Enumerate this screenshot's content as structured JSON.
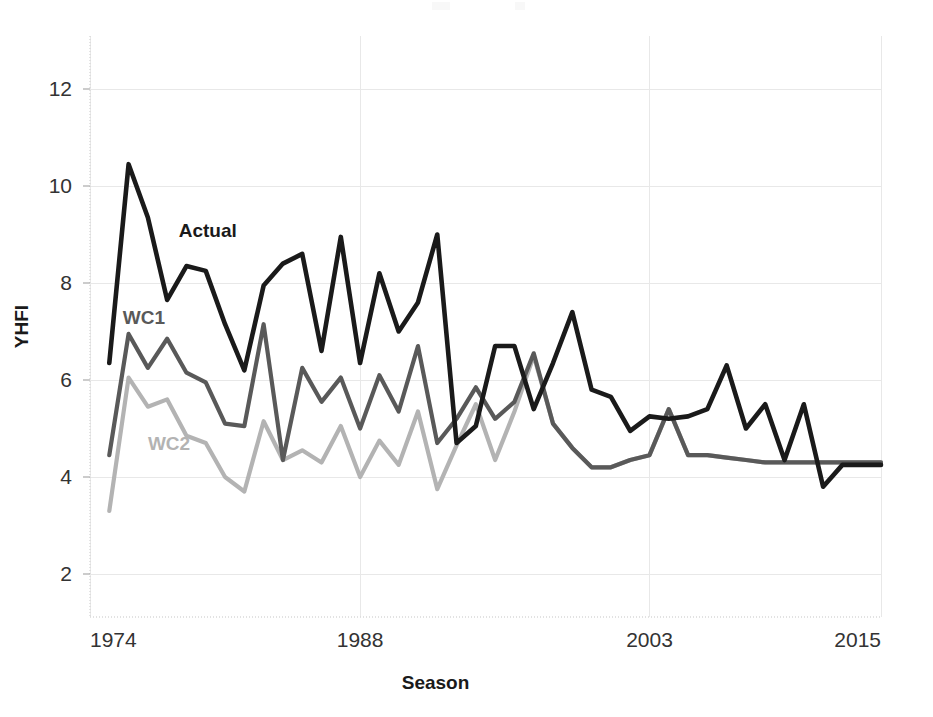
{
  "chart_data": {
    "type": "line",
    "title": "",
    "xlabel": "Season",
    "ylabel": "YHFI",
    "xlim": [
      1974,
      2015
    ],
    "ylim": [
      1.0,
      13.2
    ],
    "yticks": [
      2,
      4,
      6,
      8,
      10,
      12
    ],
    "xticks": [
      1974,
      1988,
      2003,
      2015
    ],
    "grid": true,
    "legend_position": "inline-annotations",
    "x": [
      1975,
      1976,
      1977,
      1978,
      1979,
      1980,
      1981,
      1982,
      1983,
      1984,
      1985,
      1986,
      1987,
      1988,
      1989,
      1990,
      1991,
      1992,
      1993,
      1994,
      1995,
      1996,
      1997,
      1998,
      1999,
      2000,
      2001,
      2002,
      2003,
      2004,
      2005,
      2006,
      2007,
      2008,
      2009,
      2010,
      2011,
      2012,
      2013,
      2014,
      2015
    ],
    "series": [
      {
        "name": "Actual",
        "color": "#1a1a1a",
        "values": [
          6.35,
          10.45,
          9.35,
          7.65,
          8.35,
          8.25,
          7.15,
          6.2,
          7.95,
          8.4,
          8.6,
          6.6,
          8.95,
          6.35,
          8.2,
          7.0,
          7.6,
          9.0,
          4.7,
          5.05,
          6.7,
          6.7,
          5.4,
          6.35,
          7.4,
          5.8,
          5.65,
          4.95,
          5.25,
          5.2,
          5.25,
          5.4,
          6.3,
          5.0,
          5.5,
          4.35,
          5.5,
          3.8,
          4.25,
          4.25,
          4.25
        ]
      },
      {
        "name": "WC1",
        "color": "#595959",
        "values": [
          4.45,
          6.95,
          6.25,
          6.85,
          6.15,
          5.95,
          5.1,
          5.05,
          7.15,
          4.35,
          6.25,
          5.55,
          6.05,
          5.0,
          6.1,
          5.35,
          6.7,
          4.7,
          5.2,
          5.85,
          5.2,
          5.55,
          6.55,
          5.1,
          4.6,
          4.2,
          4.2,
          4.35,
          4.45,
          5.4,
          4.45,
          4.45,
          4.4,
          4.35,
          4.3,
          4.3,
          4.3,
          4.3,
          4.3,
          4.3,
          4.3
        ]
      },
      {
        "name": "WC2",
        "color": "#b3b3b3",
        "values": [
          3.3,
          6.05,
          5.45,
          5.6,
          4.85,
          4.7,
          4.0,
          3.7,
          5.15,
          4.35,
          4.55,
          4.3,
          5.05,
          4.0,
          4.75,
          4.25,
          5.35,
          3.75,
          4.65,
          5.5,
          4.35,
          5.35,
          6.5,
          5.1,
          4.6,
          4.2,
          4.2,
          4.35,
          4.45,
          5.4,
          4.45,
          4.45,
          4.4,
          4.35,
          4.3,
          4.3,
          4.3,
          4.3,
          4.3,
          4.3,
          4.3
        ]
      }
    ],
    "annotations": [
      {
        "text": "Actual",
        "x": 1978.6,
        "y": 8.95,
        "color": "#1a1a1a"
      },
      {
        "text": "WC1",
        "x": 1975.7,
        "y": 7.15,
        "color": "#595959"
      },
      {
        "text": "WC2",
        "x": 1977.0,
        "y": 4.55,
        "color": "#b3b3b3"
      }
    ]
  },
  "axes": {
    "y_label": "YHFI",
    "x_label": "Season",
    "y_tick_labels": [
      "12",
      "10",
      "8",
      "6",
      "4",
      "2"
    ],
    "x_tick_labels": [
      "1974",
      "1988",
      "2003",
      "2015"
    ]
  },
  "colors": {
    "actual": "#1a1a1a",
    "wc1": "#595959",
    "wc2": "#b3b3b3",
    "grid": "#e8e8e8",
    "axis": "#d9d9d9",
    "background": "#ffffff"
  }
}
